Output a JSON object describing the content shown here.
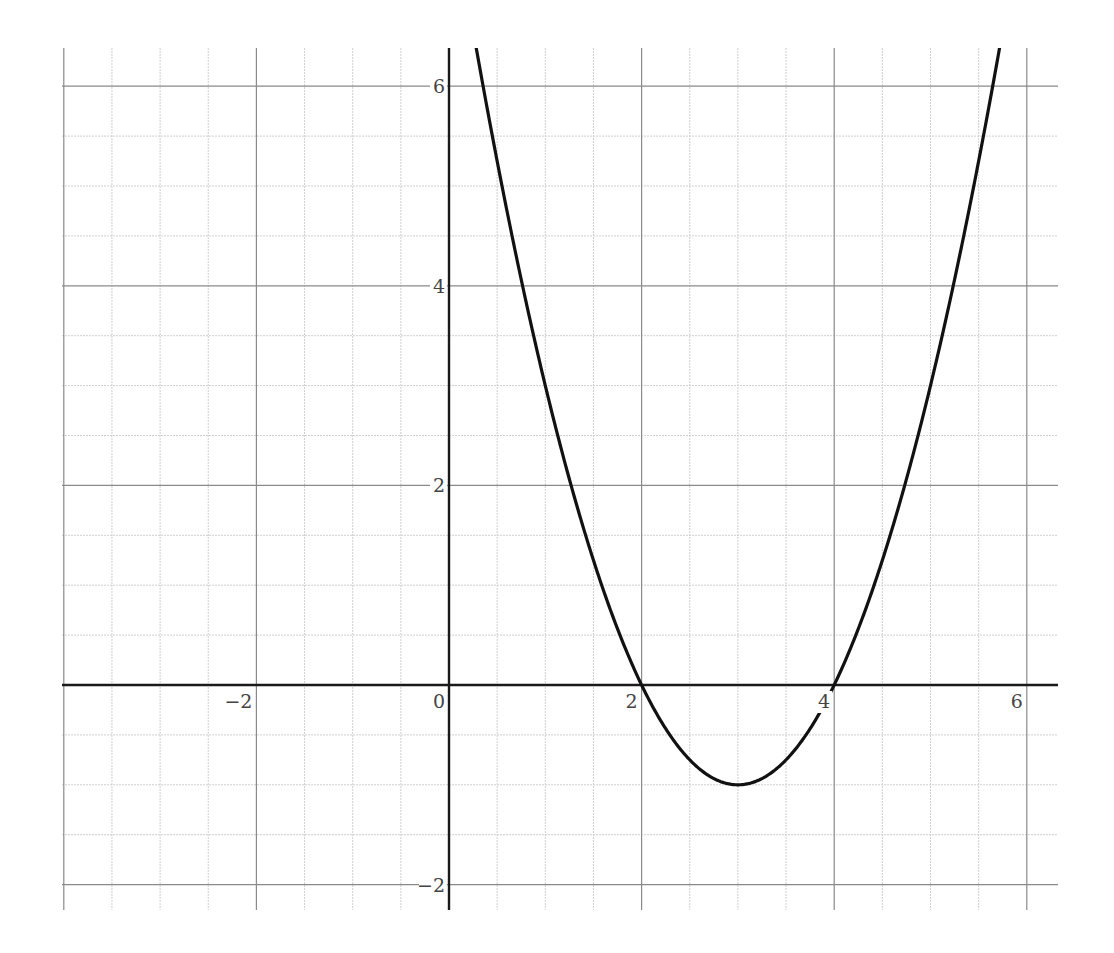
{
  "chart_data": {
    "type": "line",
    "title": "",
    "xlabel": "",
    "ylabel": "",
    "function": "f(x) = x^2 - 6x + 8 = (x-2)(x-4)",
    "xlim": [
      -4,
      6.3
    ],
    "ylim": [
      -2.25,
      6.4
    ],
    "grid": true,
    "major_grid_step": 2,
    "minor_grid_step": 0.5,
    "x_ticks": [
      -2,
      0,
      2,
      4,
      6
    ],
    "x_tick_labels": [
      "−2",
      "0",
      "2",
      "4",
      "6"
    ],
    "y_ticks": [
      -2,
      2,
      4,
      6
    ],
    "y_tick_labels": [
      "−2",
      "2",
      "4",
      "6"
    ],
    "series": [
      {
        "name": "f(x)",
        "x": [
          0.35,
          0.5,
          1,
          1.5,
          2,
          2.5,
          3,
          3.5,
          4,
          4.5,
          5,
          5.5,
          5.7
        ],
        "y": [
          6.02,
          5.25,
          3,
          1.25,
          0,
          -0.75,
          -1,
          -0.75,
          0,
          1.25,
          3,
          5.25,
          6.29
        ]
      }
    ],
    "annotations": {
      "roots": [
        2,
        4
      ],
      "vertex": [
        3,
        -1
      ]
    }
  },
  "colors": {
    "curve": "#111111",
    "axis": "#1a1a1a",
    "major_grid": "#8a8a8a",
    "minor_grid": "#cfcfcf",
    "tick_label": "#444444"
  }
}
